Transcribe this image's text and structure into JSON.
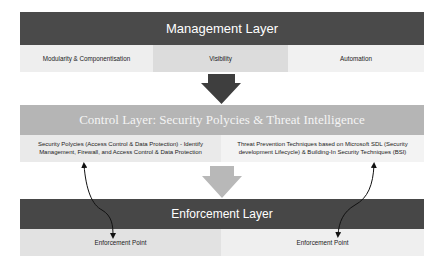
{
  "management_layer": {
    "title": "Management Layer",
    "items": [
      {
        "label": "Modularity & Componentisation"
      },
      {
        "label": "Visibility"
      },
      {
        "label": "Automation"
      }
    ]
  },
  "control_layer": {
    "title": "Control Layer: Security Polycies & Threat Intelligence",
    "items": [
      {
        "label": "Security Polycies (Access Control & Data Protection) - Identify Management, Firewall, and Access Control & Data Protection"
      },
      {
        "label": "Threat Prevention Techniques based on Microsoft SDL (Security development Lifecycle) & Building-In Security Techniques (BSI)"
      }
    ]
  },
  "enforcement_layer": {
    "title": "Enforcement Layer",
    "items": [
      {
        "label": "Enforcement Point"
      },
      {
        "label": "Enforcement Point"
      }
    ]
  },
  "colors": {
    "management_bar": "#4a4a4a",
    "control_bar": "#b5b5b5",
    "enforcement_bar": "#474747",
    "arrow_dark": "#3e3e3e",
    "arrow_light": "#b8b8b8"
  }
}
